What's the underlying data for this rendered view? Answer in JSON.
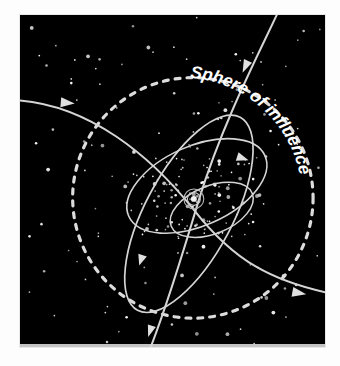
{
  "figure": {
    "title": "Sphere of Influence",
    "background_color": "#000000",
    "frame_color": "#e8e8e8",
    "page_color": "#fdfdfd",
    "line_color": "#d9d9d9",
    "star_color": "#ffffff",
    "width": 340,
    "height": 366,
    "panel": {
      "x": 19,
      "y": 14,
      "width": 307,
      "height": 334
    }
  },
  "labels": {
    "sphere_of_influence": "Sphere of influence",
    "caption": ""
  },
  "chart_data": {
    "type": "diagram",
    "title": "Sphere of influence",
    "center_body": {
      "cx": 175,
      "cy": 185,
      "radius": 4,
      "rings": [
        7,
        10
      ]
    },
    "sphere_of_influence": {
      "shape": "circle",
      "cx": 174,
      "cy": 184,
      "r": 121,
      "style": "dashed",
      "dash": "5 7",
      "stroke_width": 3.2
    },
    "orbits": [
      {
        "name": "inner-ellipse",
        "rx": 44,
        "ry": 24,
        "cx": 193,
        "cy": 196,
        "rotation": -22,
        "stroke_width": 1.5
      },
      {
        "name": "mid-ellipse",
        "rx": 75,
        "ry": 40,
        "cx": 178,
        "cy": 172,
        "rotation": -24,
        "stroke_width": 1.6,
        "arrow": {
          "x": 226,
          "y": 146,
          "angle": 20
        }
      },
      {
        "name": "outer-ellipse",
        "rx": 44,
        "ry": 110,
        "cx": 170,
        "cy": 200,
        "rotation": 28,
        "stroke_width": 1.7,
        "arrow": {
          "x": 124,
          "y": 249,
          "angle": 108
        }
      }
    ],
    "trajectories": [
      {
        "name": "flyby-inbound-top",
        "path": "M 264 0 C 243 34, 205 105, 180 186 C 163 243, 146 300, 133 345",
        "stroke_width": 2.0,
        "arrow": {
          "x": 228,
          "y": 54,
          "angle": 118
        }
      },
      {
        "name": "flyby-outbound-bottom",
        "path": "M 133 345 L 126 362",
        "stroke_width": 2.0,
        "arrow": {
          "x": 130,
          "y": 328,
          "angle": 112
        }
      },
      {
        "name": "hyperbola-left-to-right",
        "path": "M 0 86 C 70 92, 130 140, 175 196 C 212 243, 250 272, 340 285",
        "stroke_width": 2.0,
        "arrows": [
          {
            "x": 57,
            "y": 89,
            "angle": 4
          },
          {
            "x": 289,
            "y": 280,
            "angle": 11
          }
        ]
      }
    ],
    "star_count": 230,
    "legend": [],
    "axis": {
      "grid": false
    }
  }
}
